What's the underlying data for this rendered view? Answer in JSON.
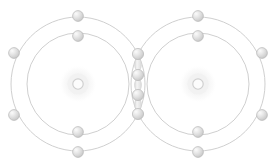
{
  "figure": {
    "width": 276,
    "height": 168,
    "background_color": "#ffffff"
  },
  "style": {
    "shell_stroke_color": "#c9c9c9",
    "shell_stroke_width": 0.9,
    "electron_fill_light": "#f2f2f2",
    "electron_fill_mid": "#d6d6d6",
    "electron_fill_dark": "#bdbdbd",
    "electron_stroke_color": "#b8b8b8",
    "electron_radius": 5.4,
    "nucleus_ring_color": "#cfcfcf",
    "nucleus_halo_color": "#ededed",
    "nucleus_ring_radius": 5.2,
    "nucleus_halo_radius": 19,
    "bond_link_color": "#e4e4e4",
    "bond_link_stroke": "#d2d2d2"
  },
  "atoms": [
    {
      "id": "atom-left",
      "label": "left atom",
      "center_x": 78,
      "center_y": 84,
      "nucleus": {
        "cx": 78,
        "cy": 84
      },
      "shells": [
        {
          "id": "left-inner-shell",
          "label": "inner shell",
          "radius": 51
        },
        {
          "id": "left-outer-shell",
          "label": "outer shell",
          "radius": 67
        }
      ],
      "electrons": [
        {
          "id": "left-inner-top",
          "shell": "inner",
          "cx": 78,
          "cy": 36
        },
        {
          "id": "left-inner-bottom",
          "shell": "inner",
          "cx": 78,
          "cy": 132
        },
        {
          "id": "left-outer-top",
          "shell": "outer",
          "cx": 78,
          "cy": 16
        },
        {
          "id": "left-outer-bottom",
          "shell": "outer",
          "cx": 78,
          "cy": 152
        },
        {
          "id": "left-outer-upper-left",
          "shell": "outer",
          "cx": 14,
          "cy": 53
        },
        {
          "id": "left-outer-lower-left",
          "shell": "outer",
          "cx": 14,
          "cy": 115
        }
      ]
    },
    {
      "id": "atom-right",
      "label": "right atom",
      "center_x": 198,
      "center_y": 84,
      "nucleus": {
        "cx": 198,
        "cy": 84
      },
      "shells": [
        {
          "id": "right-inner-shell",
          "label": "inner shell",
          "radius": 51
        },
        {
          "id": "right-outer-shell",
          "label": "outer shell",
          "radius": 67
        }
      ],
      "electrons": [
        {
          "id": "right-inner-top",
          "shell": "inner",
          "cx": 198,
          "cy": 36
        },
        {
          "id": "right-inner-bottom",
          "shell": "inner",
          "cx": 198,
          "cy": 132
        },
        {
          "id": "right-outer-top",
          "shell": "outer",
          "cx": 198,
          "cy": 16
        },
        {
          "id": "right-outer-bottom",
          "shell": "outer",
          "cx": 198,
          "cy": 152
        },
        {
          "id": "right-outer-upper-right",
          "shell": "outer",
          "cx": 262,
          "cy": 53
        },
        {
          "id": "right-outer-lower-right",
          "shell": "outer",
          "cx": 262,
          "cy": 115
        }
      ]
    }
  ],
  "shared_electrons": [
    {
      "id": "shared-1",
      "label": "shared electron 1",
      "cx": 138,
      "cy": 54
    },
    {
      "id": "shared-2",
      "label": "shared electron 2",
      "cx": 138,
      "cy": 75
    },
    {
      "id": "shared-3",
      "label": "shared electron 3",
      "cx": 138,
      "cy": 95
    },
    {
      "id": "shared-4",
      "label": "shared electron 4",
      "cx": 138,
      "cy": 114
    }
  ],
  "bond_links": [
    {
      "id": "bond-link-1",
      "label": "bonding pair connector 1",
      "cx": 138,
      "cy": 64.5,
      "rx": 3.4,
      "ry": 6.2
    },
    {
      "id": "bond-link-2",
      "label": "bonding pair connector 2",
      "cx": 138,
      "cy": 85.0,
      "rx": 3.4,
      "ry": 6.2
    },
    {
      "id": "bond-link-3",
      "label": "bonding pair connector 3",
      "cx": 138,
      "cy": 104.5,
      "rx": 3.4,
      "ry": 6.2
    }
  ]
}
